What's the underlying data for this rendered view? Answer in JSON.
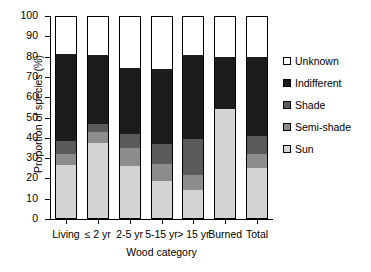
{
  "chart_data": {
    "type": "bar",
    "subtype": "stacked-bar-100",
    "title": "",
    "xlabel": "Wood category",
    "ylabel": "Proportion of species (%)",
    "ylim": [
      0,
      100
    ],
    "ytick_labels": [
      "100",
      "90",
      "80",
      "70",
      "60",
      "50",
      "40",
      "30",
      "20",
      "10",
      "0"
    ],
    "ytick_values": [
      100,
      90,
      80,
      70,
      60,
      50,
      40,
      30,
      20,
      10,
      0
    ],
    "grid": false,
    "legend_position": "right",
    "categories": [
      "Living",
      "≤ 2 yr",
      "2-5 yr",
      "5-15 yr",
      "> 15 yr",
      "Burned",
      "Total"
    ],
    "series": [
      {
        "name": "Sun",
        "color": "#d4d4d4",
        "values": [
          26.5,
          37.5,
          26.0,
          18.5,
          14.5,
          54.0,
          25.0
        ]
      },
      {
        "name": "Semi-shade",
        "color": "#8c8c8c",
        "values": [
          5.5,
          5.5,
          9.0,
          8.5,
          7.0,
          0.0,
          7.0
        ]
      },
      {
        "name": "Shade",
        "color": "#5a5a5a",
        "values": [
          6.5,
          4.0,
          7.0,
          10.0,
          18.0,
          0.0,
          9.0
        ]
      },
      {
        "name": "Indifferent",
        "color": "#1c1c1c",
        "values": [
          43.0,
          34.0,
          32.5,
          37.0,
          41.5,
          26.0,
          39.0
        ]
      },
      {
        "name": "Unknown",
        "color": "#ffffff",
        "values": [
          18.5,
          19.0,
          25.5,
          26.0,
          19.0,
          20.0,
          20.0
        ]
      }
    ],
    "cumulative_tops": {
      "Living": [
        26.5,
        32.0,
        38.5,
        81.5,
        100
      ],
      "≤ 2 yr": [
        37.5,
        43.0,
        47.0,
        81.0,
        100
      ],
      "2-5 yr": [
        26.0,
        35.0,
        42.0,
        74.5,
        100
      ],
      "5-15 yr": [
        18.5,
        27.0,
        37.0,
        74.0,
        100
      ],
      "> 15 yr": [
        14.5,
        21.5,
        39.5,
        81.0,
        100
      ],
      "Burned": [
        54.0,
        54.0,
        54.0,
        80.0,
        100
      ],
      "Total": [
        25.0,
        32.0,
        41.0,
        80.0,
        100
      ]
    },
    "legend_entries": [
      {
        "label": "Unknown",
        "color": "#ffffff"
      },
      {
        "label": "Indifferent",
        "color": "#1c1c1c"
      },
      {
        "label": "Shade",
        "color": "#5a5a5a"
      },
      {
        "label": "Semi-shade",
        "color": "#8c8c8c"
      },
      {
        "label": "Sun",
        "color": "#d4d4d4"
      }
    ]
  }
}
